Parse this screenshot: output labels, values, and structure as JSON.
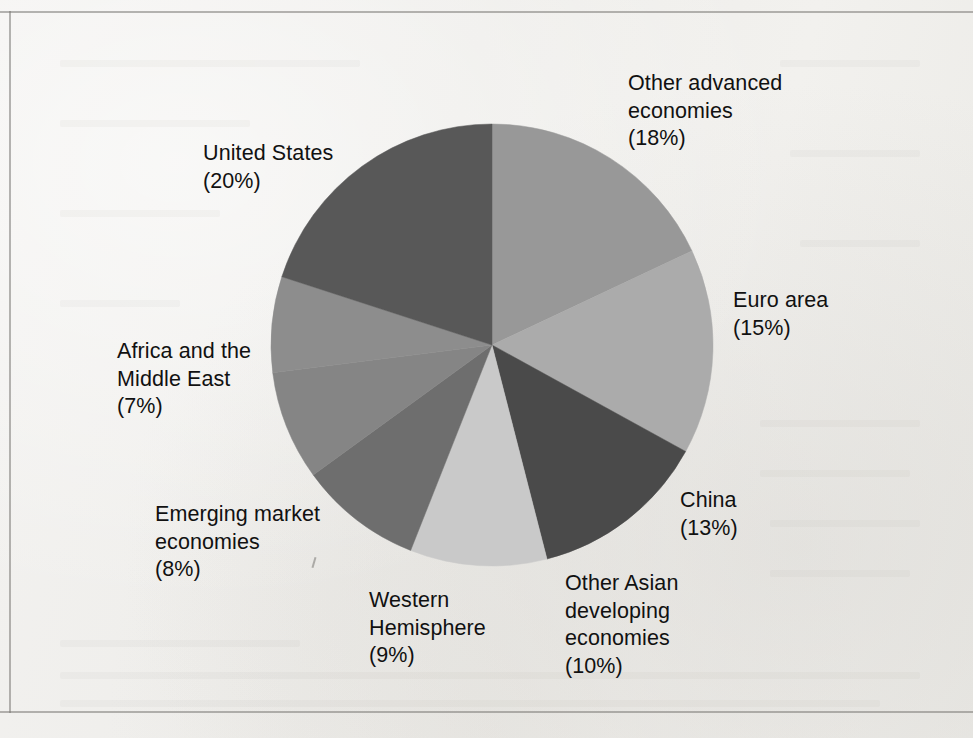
{
  "figure": {
    "background_color": "#f1f0ee",
    "text_color": "#111111"
  },
  "chart_data": {
    "type": "pie",
    "title": "",
    "subtitle": "",
    "xlabel": "",
    "ylabel": "",
    "legend_position": "none",
    "grid": false,
    "units": "percent",
    "start_angle_deg": 0,
    "direction": "clockwise",
    "center": {
      "x": 492,
      "y": 345,
      "radius": 221
    },
    "categories": [
      "Other advanced economies",
      "Euro area",
      "China",
      "Other Asian developing economies",
      "Western Hemisphere",
      "Emerging market economies",
      "Africa and the Middle East",
      "United States"
    ],
    "values": [
      18,
      15,
      13,
      10,
      9,
      8,
      7,
      20
    ],
    "total": 100,
    "slices": [
      {
        "label": "Other advanced economies",
        "label_text": "Other advanced\neconomies\n(18%)",
        "value": 18,
        "percent_text": "(18%)",
        "color": "#989898",
        "start_deg": 0,
        "end_deg": 64.8
      },
      {
        "label": "Euro area",
        "label_text": "Euro area\n(15%)",
        "value": 15,
        "percent_text": "(15%)",
        "color": "#ababab",
        "start_deg": 64.8,
        "end_deg": 118.8
      },
      {
        "label": "China",
        "label_text": "China\n(13%)",
        "value": 13,
        "percent_text": "(13%)",
        "color": "#4a4a4a",
        "start_deg": 118.8,
        "end_deg": 165.6
      },
      {
        "label": "Other Asian developing economies",
        "label_text": "Other Asian\ndeveloping\neconomies\n(10%)",
        "value": 10,
        "percent_text": "(10%)",
        "color": "#c9c9c9",
        "start_deg": 165.6,
        "end_deg": 201.6
      },
      {
        "label": "Western Hemisphere",
        "label_text": "Western\nHemisphere\n(9%)",
        "value": 9,
        "percent_text": "(9%)",
        "color": "#6e6e6e",
        "start_deg": 201.6,
        "end_deg": 234.0
      },
      {
        "label": "Emerging market economies",
        "label_text": "Emerging market\neconomies\n(8%)",
        "value": 8,
        "percent_text": "(8%)",
        "color": "#858585",
        "start_deg": 234.0,
        "end_deg": 262.8
      },
      {
        "label": "Africa and the Middle East",
        "label_text": "Africa and the\nMiddle East\n(7%)",
        "value": 7,
        "percent_text": "(7%)",
        "color": "#8d8d8d",
        "start_deg": 262.8,
        "end_deg": 288.0
      },
      {
        "label": "United States",
        "label_text": "United States\n(20%)",
        "value": 20,
        "percent_text": "(20%)",
        "color": "#585858",
        "start_deg": 288.0,
        "end_deg": 360.0
      }
    ]
  },
  "labels": {
    "other_advanced": "Other advanced\neconomies\n(18%)",
    "euro_area": "Euro area\n(15%)",
    "china": "China\n(13%)",
    "other_asian": "Other Asian\ndeveloping\neconomies\n(10%)",
    "western_hemisphere": "Western\nHemisphere\n(9%)",
    "emerging_market": "Emerging market\neconomies\n(8%)",
    "africa_middle_east": "Africa and the\nMiddle East\n(7%)",
    "united_states": "United States\n(20%)"
  }
}
